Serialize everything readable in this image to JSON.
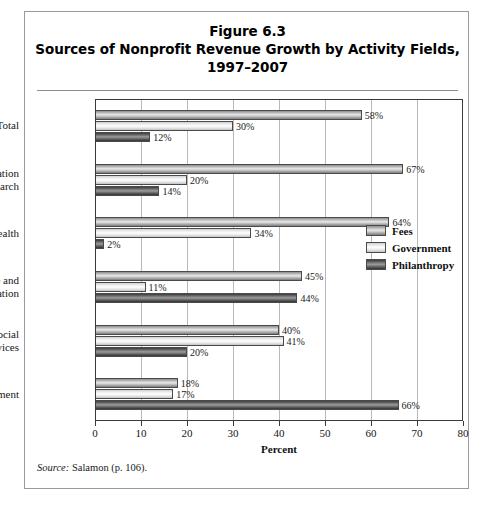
{
  "figure": {
    "title_lines": [
      "Figure 6.3",
      "Sources of Nonprofit Revenue Growth by Activity Fields,",
      "1997–2007"
    ],
    "source_keyword": "Source:",
    "source_text": " Salamon (p. 106)."
  },
  "legend": {
    "items": [
      {
        "label": "Fees",
        "key": "fees",
        "color": "#c8c8c8"
      },
      {
        "label": "Government",
        "key": "government",
        "color": "#f3f3f3"
      },
      {
        "label": "Philanthropy",
        "key": "philanthropy",
        "color": "#565656"
      }
    ]
  },
  "chart_data": {
    "type": "bar",
    "orientation": "horizontal",
    "xlabel": "Percent",
    "ylabel": "",
    "xlim": [
      0,
      80
    ],
    "xticks": [
      0,
      10,
      20,
      30,
      40,
      50,
      60,
      70,
      80
    ],
    "xtick_labels": [
      "0",
      "10",
      "20",
      "30",
      "40",
      "50",
      "60",
      "70",
      "80"
    ],
    "grid": true,
    "grid_axis": "x",
    "legend_position": "right-middle",
    "value_suffix": "%",
    "categories": [
      "Total",
      "Education and Research",
      "Health",
      "Culture and Recreation",
      "Social Services",
      "Environment"
    ],
    "category_label_lines": [
      [
        "Total"
      ],
      [
        "Education",
        "and Research"
      ],
      [
        "Health"
      ],
      [
        "Culture and",
        "Recreation"
      ],
      [
        "Social",
        "Services"
      ],
      [
        "Environment"
      ]
    ],
    "series": [
      {
        "name": "Fees",
        "key": "fees",
        "values": [
          58,
          67,
          64,
          45,
          40,
          18
        ]
      },
      {
        "name": "Government",
        "key": "government",
        "values": [
          30,
          20,
          34,
          11,
          41,
          17
        ]
      },
      {
        "name": "Philanthropy",
        "key": "philanthropy",
        "values": [
          12,
          14,
          2,
          44,
          20,
          66
        ]
      }
    ],
    "data_labels": [
      {
        "category": "Total",
        "fees": "58%",
        "government": "30%",
        "philanthropy": "12%"
      },
      {
        "category": "Education and Research",
        "fees": "67%",
        "government": "20%",
        "philanthropy": "14%"
      },
      {
        "category": "Health",
        "fees": "64%",
        "government": "34%",
        "philanthropy": "2%"
      },
      {
        "category": "Culture and Recreation",
        "fees": "45%",
        "government": "11%",
        "philanthropy": "44%"
      },
      {
        "category": "Social Services",
        "fees": "40%",
        "government": "41%",
        "philanthropy": "20%"
      },
      {
        "category": "Environment",
        "fees": "18%",
        "government": "17%",
        "philanthropy": "66%"
      }
    ]
  }
}
